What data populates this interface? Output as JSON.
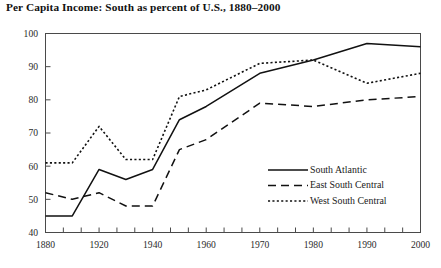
{
  "chart_data": {
    "type": "line",
    "title": "Per Capita Income: South as percent of U.S., 1880–2000",
    "xlabel": "",
    "ylabel": "",
    "ylim": [
      40,
      100
    ],
    "yticks": [
      40,
      50,
      60,
      70,
      80,
      90,
      100
    ],
    "xticks": [
      1880,
      1920,
      1940,
      1960,
      1970,
      1980,
      1990,
      2000
    ],
    "x": [
      1880,
      1900,
      1920,
      1930,
      1940,
      1950,
      1960,
      1970,
      1980,
      1990,
      2000
    ],
    "grid": false,
    "legend_position": "lower right",
    "series": [
      {
        "name": "South Atlantic",
        "style": "solid",
        "values": [
          45,
          45,
          59,
          56,
          59,
          74,
          78,
          88,
          92,
          97,
          96
        ]
      },
      {
        "name": "East South Central",
        "style": "long-dash",
        "values": [
          52,
          50,
          52,
          48,
          48,
          65,
          68,
          79,
          78,
          80,
          81
        ]
      },
      {
        "name": "West South Central",
        "style": "dotted",
        "values": [
          61,
          61,
          72,
          62,
          62,
          81,
          83,
          91,
          92,
          85,
          88
        ]
      }
    ]
  },
  "axis": {
    "ytick_labels": [
      "100",
      "90",
      "80",
      "70",
      "60",
      "50",
      "40"
    ],
    "xtick_labels": [
      "1880",
      "1920",
      "1940",
      "1960",
      "1970",
      "1980",
      "1990",
      "2000"
    ]
  },
  "legend": {
    "entries": [
      {
        "label": "South Atlantic",
        "style": "solid"
      },
      {
        "label": "East South Central",
        "style": "long-dash"
      },
      {
        "label": "West South Central",
        "style": "dotted"
      }
    ]
  }
}
